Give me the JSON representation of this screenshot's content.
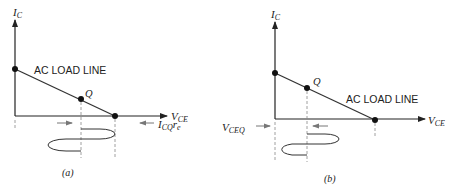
{
  "panel_a": {
    "caption": "(a)",
    "y_axis_label": "I",
    "y_axis_sub": "C",
    "x_axis_label": "V",
    "x_axis_sub": "CE",
    "line_label": "AC LOAD LINE",
    "q_label": "Q",
    "right_annotation": "I",
    "right_annotation_sub": "CQ",
    "right_annotation_tail": "r",
    "right_annotation_tail_sub": "e"
  },
  "panel_b": {
    "caption": "(b)",
    "y_axis_label": "I",
    "y_axis_sub": "C",
    "x_axis_label": "V",
    "x_axis_sub": "CE",
    "line_label": "AC LOAD LINE",
    "q_label": "Q",
    "left_annotation": "V",
    "left_annotation_sub": "CEQ"
  },
  "colors": {
    "ink": "#222222",
    "arrow_gray": "#777777"
  }
}
